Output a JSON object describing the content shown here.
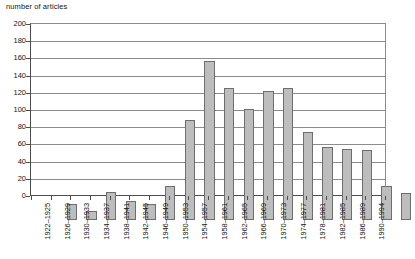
{
  "chart_data": {
    "type": "bar",
    "title": "number of articles",
    "xlabel": "",
    "ylabel": "number of articles",
    "ylim": [
      0,
      200
    ],
    "ytick_step": 20,
    "yticks": [
      0,
      20,
      40,
      60,
      80,
      100,
      120,
      140,
      160,
      180,
      200
    ],
    "grid": true,
    "legend": null,
    "legend_position": "none",
    "bar_color": "#bdbdbd",
    "bar_border_color": "#6e6e6e",
    "gridline_color": "#8c8c8c",
    "axis_color": "#4d4d4d",
    "categories": [
      "1922–1925",
      "1926–1929",
      "1930–1933",
      "1934–1937",
      "1938–1941",
      "1942–1945",
      "1946–1949",
      "1950–1953",
      "1954–1957",
      "1958–1961",
      "1962–1965",
      "1966–1969",
      "1970–1973",
      "1974–1977",
      "1978–1981",
      "1982–1985",
      "1986–1989",
      "1990–1994"
    ],
    "values": [
      19,
      11,
      32,
      22,
      19,
      40,
      116,
      185,
      154,
      129,
      150,
      154,
      102,
      85,
      82,
      81,
      40,
      31
    ]
  }
}
